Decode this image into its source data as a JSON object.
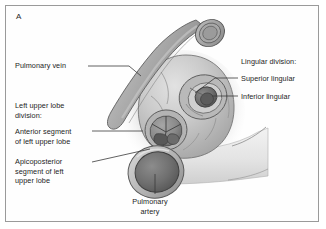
{
  "figure": {
    "panel_letter": "A",
    "background_color": "#ffffff",
    "frame_color": "#9a9a9a",
    "text_color": "#1d1d1d"
  },
  "labels": {
    "pulmonary_vein": "Pulmonary vein",
    "left_upper_lobe_division": "Left upper lobe\ndivision:",
    "anterior_segment": "Anterior segment\nof left upper lobe",
    "apicoposterior_segment": "Apicoposterior\nsegment of left\nupper lobe",
    "lingular_division": "Lingular division:",
    "superior_lingular": "Superior lingular",
    "inferior_lingular": "Inferior lingular",
    "pulmonary_artery": "Pulmonary\nartery"
  },
  "anatomy": {
    "vein_tube_color": "#9d9d9d",
    "bronchus_mass_color": "#c3c3c3",
    "artery_lumen_color": "#6e6e6e",
    "lingular_lumen_color": "#6d6d6d",
    "outline_color": "#4a4a4a",
    "shadow_color": "#d9d9d9"
  }
}
